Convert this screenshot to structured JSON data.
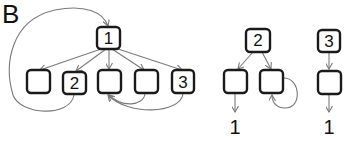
{
  "panel_label": "B",
  "trees": [
    {
      "name": "tree-1",
      "root": {
        "label": "1"
      },
      "children": [
        {
          "label": ""
        },
        {
          "label": "2"
        },
        {
          "label": ""
        },
        {
          "label": ""
        },
        {
          "label": "3"
        }
      ],
      "back_edges": [
        {
          "from": "child-2",
          "to": "root",
          "description": "loop from node 2 back to root 1"
        },
        {
          "from": "child-4",
          "to": "child-3"
        },
        {
          "from": "child-5",
          "to": "child-3"
        }
      ]
    },
    {
      "name": "tree-2",
      "root": {
        "label": "2"
      },
      "children": [
        {
          "label": "",
          "leaf": "1"
        },
        {
          "label": "",
          "self_loop": true
        }
      ]
    },
    {
      "name": "tree-3",
      "root": {
        "label": "3"
      },
      "children": [
        {
          "label": "",
          "leaf": "1"
        }
      ]
    }
  ],
  "leaf_labels": {
    "tree2": "1",
    "tree3": "1"
  },
  "colors": {
    "box_stroke": "#1a1a1a",
    "edge": "#7a7a7a",
    "background": "#ffffff"
  }
}
